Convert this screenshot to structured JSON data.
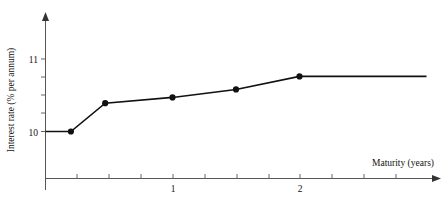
{
  "chart_data": {
    "type": "line",
    "title": "",
    "subtitle": "",
    "xlabel": "Maturity (years)",
    "ylabel": "Interest rate (% per annum)",
    "xlim": [
      0,
      3.0
    ],
    "ylim": [
      9.6,
      11.35
    ],
    "grid": false,
    "legend": null,
    "xticks": [
      0.25,
      0.5,
      0.75,
      1,
      1.25,
      1.5,
      1.75,
      2,
      2.25,
      2.5,
      2.75
    ],
    "xtick_labels": [
      "",
      "",
      "",
      "1",
      "",
      "",
      "",
      "2",
      "",
      "",
      ""
    ],
    "yticks": [
      10,
      10.25,
      10.5,
      10.75,
      11
    ],
    "ytick_labels": [
      "10",
      "",
      "",
      "",
      "11"
    ],
    "x": [
      0.0,
      0.2,
      0.47,
      1.0,
      1.5,
      2.0,
      3.0
    ],
    "y": [
      10.0,
      10.0,
      10.39,
      10.47,
      10.58,
      10.76,
      10.76
    ],
    "markers_x": [
      0.2,
      0.47,
      1.0,
      1.5,
      2.0
    ],
    "markers_y": [
      10.0,
      10.39,
      10.47,
      10.58,
      10.76
    ],
    "series": [
      {
        "name": "yield curve",
        "x": [
          0.0,
          0.2,
          0.47,
          1.0,
          1.5,
          2.0,
          3.0
        ],
        "values": [
          10.0,
          10.0,
          10.39,
          10.47,
          10.58,
          10.76,
          10.76
        ],
        "color": "#111111"
      }
    ],
    "axis_color": "#555555",
    "line_color": "#111111",
    "marker_color": "#111111",
    "background": "#ffffff"
  },
  "labels": {
    "y_11": "11",
    "y_10": "10",
    "x_1": "1",
    "x_2": "2",
    "x_title": "Maturity (years)",
    "y_title": "Interest rate (% per annum)"
  }
}
